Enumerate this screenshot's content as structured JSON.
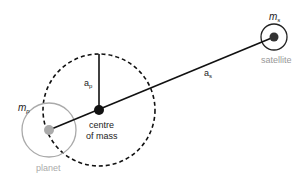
{
  "diagram": {
    "labels": {
      "planet_mass": "m",
      "planet_mass_sub": "p",
      "satellite_mass": "m",
      "satellite_mass_sub": "s",
      "planet_distance": "a",
      "planet_distance_sub": "p",
      "satellite_distance": "a",
      "satellite_distance_sub": "s",
      "centre_line1": "centre",
      "centre_line2": "of mass",
      "planet": "planet",
      "satellite": "satellite"
    },
    "colors": {
      "line": "#111111",
      "planet_fill": "#aaaaaa",
      "planet_ring": "#aaaaaa",
      "satellite_fill": "#333333",
      "satellite_ring": "#222222",
      "label_gray": "#999999",
      "label_dark": "#222222"
    },
    "geometry": {
      "centre_of_mass": [
        99,
        110
      ],
      "orbit_radius": 56,
      "planet_center": [
        49,
        130
      ],
      "planet_radius": 27,
      "satellite_center": [
        274,
        37
      ],
      "satellite_radius": 13
    }
  }
}
